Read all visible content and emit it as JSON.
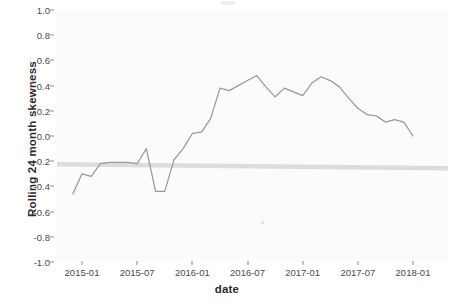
{
  "chart_data": {
    "type": "line",
    "title": "",
    "xlabel": "date",
    "ylabel": "Rolling  24  month skewness",
    "ylim": [
      -1.0,
      1.0
    ],
    "xlim": [
      "2014-12",
      "2018-02"
    ],
    "grid": false,
    "legend": null,
    "y_ticks": [
      "1.0",
      "0.8",
      "0.6",
      "0.4",
      "0.2",
      "0.0",
      "-0.2",
      "-0.4",
      "-0.6",
      "-0.8",
      "-1.0"
    ],
    "y_tick_values": [
      1.0,
      0.8,
      0.6,
      0.4,
      0.2,
      0.0,
      -0.2,
      -0.4,
      -0.6,
      -0.8,
      -1.0
    ],
    "x_ticks": [
      "2015-01",
      "2015-07",
      "2016-01",
      "2016-07",
      "2017-01",
      "2017-07",
      "2018-01"
    ],
    "series": [
      {
        "name": "Rolling 24 month skewness",
        "color": "#999999",
        "x": [
          "2014-12",
          "2015-01",
          "2015-02",
          "2015-03",
          "2015-04",
          "2015-05",
          "2015-06",
          "2015-07",
          "2015-08",
          "2015-09",
          "2015-10",
          "2015-11",
          "2015-12",
          "2016-01",
          "2016-02",
          "2016-03",
          "2016-04",
          "2016-05",
          "2016-06",
          "2016-07",
          "2016-08",
          "2016-09",
          "2016-10",
          "2016-11",
          "2016-12",
          "2017-01",
          "2017-02",
          "2017-03",
          "2017-04",
          "2017-05",
          "2017-06",
          "2017-07",
          "2017-08",
          "2017-09",
          "2017-10",
          "2017-11",
          "2017-12",
          "2018-01"
        ],
        "values": [
          -0.46,
          -0.3,
          -0.32,
          -0.22,
          -0.21,
          -0.21,
          -0.21,
          -0.22,
          -0.1,
          -0.44,
          -0.44,
          -0.19,
          -0.1,
          0.02,
          0.03,
          0.14,
          0.38,
          0.36,
          0.4,
          0.44,
          0.48,
          0.39,
          0.31,
          0.38,
          0.35,
          0.32,
          0.42,
          0.47,
          0.44,
          0.39,
          0.3,
          0.22,
          0.17,
          0.16,
          0.11,
          0.13,
          0.11,
          0.0
        ]
      },
      {
        "name": "reference band",
        "color": "#dcdcdc",
        "type": "hline",
        "y_start": -0.225,
        "y_end": -0.255
      }
    ],
    "annotations": []
  },
  "axes": {
    "y_title": "Rolling  24  month skewness",
    "x_title": "date"
  }
}
